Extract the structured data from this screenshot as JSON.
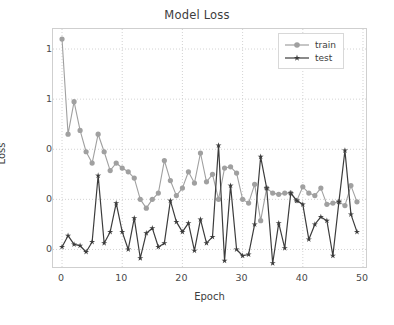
{
  "chart_data": {
    "type": "line",
    "title": "Model Loss",
    "xlabel": "Epoch",
    "ylabel": "Loss",
    "xlim": [
      -1.5,
      50.5
    ],
    "ylim": [
      0.33,
      1.28
    ],
    "grid": true,
    "grid_style": "dotted",
    "legend_position": "upper right",
    "xticks": [
      0,
      10,
      20,
      30,
      40,
      50
    ],
    "xtick_labels": [
      "0",
      "10",
      "20",
      "30",
      "40",
      "50"
    ],
    "yticks": [
      0.4,
      0.6,
      0.8,
      1.0,
      1.2
    ],
    "ytick_labels": [
      "0.4",
      "0.6",
      "0.8",
      "1.0",
      "1.2"
    ],
    "x": [
      0,
      1,
      2,
      3,
      4,
      5,
      6,
      7,
      8,
      9,
      10,
      11,
      12,
      13,
      14,
      15,
      16,
      17,
      18,
      19,
      20,
      21,
      22,
      23,
      24,
      25,
      26,
      27,
      28,
      29,
      30,
      31,
      32,
      33,
      34,
      35,
      36,
      37,
      38,
      39,
      40,
      41,
      42,
      43,
      44,
      45,
      46,
      47,
      48,
      49
    ],
    "series": [
      {
        "name": "train",
        "color": "#a0a0a0",
        "marker": "circle",
        "values": [
          1.24,
          0.86,
          0.99,
          0.875,
          0.79,
          0.745,
          0.86,
          0.79,
          0.715,
          0.745,
          0.725,
          0.71,
          0.685,
          0.6,
          0.565,
          0.6,
          0.625,
          0.755,
          0.675,
          0.615,
          0.645,
          0.71,
          0.665,
          0.785,
          0.67,
          0.7,
          0.6,
          0.725,
          0.73,
          0.705,
          0.6,
          0.585,
          0.66,
          0.515,
          0.645,
          0.625,
          0.62,
          0.625,
          0.625,
          0.595,
          0.65,
          0.625,
          0.615,
          0.645,
          0.58,
          0.585,
          0.59,
          0.575,
          0.655,
          0.59
        ]
      },
      {
        "name": "test",
        "color": "#3c3c3c",
        "marker": "star",
        "values": [
          0.41,
          0.455,
          0.42,
          0.415,
          0.39,
          0.43,
          0.695,
          0.425,
          0.47,
          0.585,
          0.47,
          0.4,
          0.525,
          0.365,
          0.465,
          0.485,
          0.41,
          0.425,
          0.595,
          0.51,
          0.47,
          0.505,
          0.395,
          0.52,
          0.425,
          0.45,
          0.815,
          0.355,
          0.655,
          0.4,
          0.375,
          0.38,
          0.5,
          0.77,
          0.645,
          0.345,
          0.505,
          0.405,
          0.625,
          0.595,
          0.58,
          0.44,
          0.5,
          0.53,
          0.515,
          0.375,
          0.59,
          0.795,
          0.54,
          0.47
        ]
      }
    ]
  },
  "legend": {
    "items": [
      {
        "label": "train"
      },
      {
        "label": "test"
      }
    ]
  },
  "colors": {
    "train": "#a0a0a0",
    "test": "#3c3c3c",
    "grid": "#c8c8c8",
    "axis": "#cfcfcf",
    "text": "#3d3d3d",
    "background": "#ffffff"
  }
}
